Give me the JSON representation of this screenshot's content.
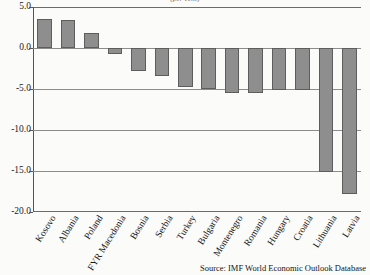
{
  "chart_data": {
    "type": "bar",
    "title": "(per cent)",
    "xlabel": "",
    "ylabel": "",
    "ylim": [
      -20.0,
      5.0
    ],
    "grid": true,
    "legend": null,
    "ytick_labels": [
      "5.0",
      "0.0",
      "-5.0",
      "-10.0",
      "-15.0",
      "-20.0"
    ],
    "ytick_values": [
      5.0,
      0.0,
      -5.0,
      -10.0,
      -15.0,
      -20.0
    ],
    "categories": [
      "Kosovo",
      "Albania",
      "Poland",
      "FYR Macedonia",
      "Bosnia",
      "Serbia",
      "Turkey",
      "Bulgaria",
      "Montenegro",
      "Romania",
      "Hungary",
      "Croatia",
      "Lithuania",
      "Latvia"
    ],
    "values": [
      3.5,
      3.4,
      1.8,
      -0.7,
      -2.8,
      -3.4,
      -4.7,
      -5.0,
      -5.5,
      -5.5,
      -5.1,
      -5.1,
      -15.1,
      -17.8
    ],
    "bar_color": "#8e8e8e",
    "bar_edge_color": "#5d5d5d"
  },
  "source": {
    "note": "Source: IMF World Economic Outlook Database"
  }
}
